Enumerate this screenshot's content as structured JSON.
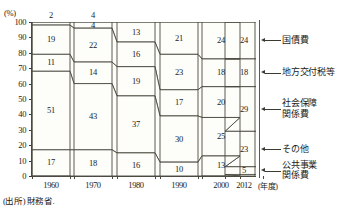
{
  "axis": {
    "unit": "(%)",
    "y_ticks": [
      "100",
      "90",
      "80",
      "70",
      "60",
      "50",
      "40",
      "30",
      "20",
      "10",
      "0"
    ],
    "x_ticks": [
      "1960",
      "1970",
      "1980",
      "1990",
      "2000",
      "2012"
    ],
    "x_unit": "(年度)"
  },
  "legend": {
    "items": [
      {
        "label": "国債費"
      },
      {
        "label": "地方交付税等"
      },
      {
        "label": "社会保障\n関係費"
      },
      {
        "label": "その他"
      },
      {
        "label": "公共事業\n関係費"
      }
    ]
  },
  "source": {
    "text": "(出所) 財務省."
  },
  "top_labels": [
    {
      "year": "1960",
      "value": "2"
    },
    {
      "year": "1970",
      "value": "4"
    }
  ],
  "chart_data": {
    "type": "area",
    "title": "",
    "xlabel": "(年度)",
    "ylabel": "(%)",
    "ylim": [
      0,
      100
    ],
    "grid": false,
    "legend_position": "right",
    "x": [
      "1960",
      "1970",
      "1980",
      "1990",
      "2000",
      "2012"
    ],
    "stack_order_top_to_bottom": [
      "国債費",
      "地方交付税等",
      "社会保障関係費",
      "その他",
      "公共事業関係費"
    ],
    "series": [
      {
        "name": "国債費",
        "values": [
          2,
          4,
          13,
          21,
          24,
          24
        ]
      },
      {
        "name": "地方交付税等",
        "values": [
          19,
          22,
          16,
          23,
          18,
          18
        ]
      },
      {
        "name": "社会保障関係費",
        "values": [
          11,
          14,
          19,
          17,
          20,
          29
        ]
      },
      {
        "name": "その他",
        "values": [
          51,
          43,
          37,
          30,
          25,
          23
        ]
      },
      {
        "name": "公共事業関係費",
        "values": [
          17,
          18,
          16,
          10,
          13,
          5
        ]
      }
    ],
    "labels_on_chart": {
      "国債費": [
        "2",
        "4",
        "13",
        "21",
        "24",
        "24"
      ],
      "地方交付税等": [
        "19",
        "22",
        "16",
        "23",
        "18",
        "18"
      ],
      "社会保障関係費": [
        "11",
        "14",
        "19",
        "17",
        "20",
        "29"
      ],
      "その他": [
        "51",
        "43",
        "37",
        "30",
        "25",
        "23"
      ],
      "公共事業関係費": [
        "17",
        "18",
        "16",
        "10",
        "13",
        "5"
      ]
    }
  }
}
